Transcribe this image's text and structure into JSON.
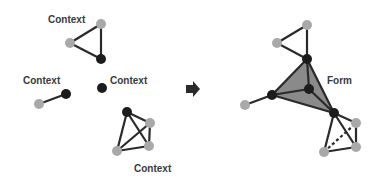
{
  "colors": {
    "background": "#ffffff",
    "edge": "#2a2a2a",
    "node_black": "#1c1c1c",
    "node_gray": "#a9a9a9",
    "form_fill": "#8a8a8a",
    "label": "#3a3a3a",
    "arrow": "#2a2a2a"
  },
  "labels": {
    "context_top": "Context",
    "context_left": "Context",
    "context_middle": "Context",
    "context_bottom": "Context",
    "form": "Form"
  },
  "left_panel": {
    "title": "Separate contexts",
    "groups": [
      {
        "name": "triangle",
        "label": "Context",
        "nodes": [
          "gray",
          "gray",
          "black"
        ]
      },
      {
        "name": "edge-pair",
        "label": "Context",
        "nodes": [
          "black",
          "gray"
        ]
      },
      {
        "name": "single-node",
        "label": "Context",
        "nodes": [
          "black"
        ]
      },
      {
        "name": "k4-clique",
        "label": "Context",
        "nodes": [
          "black",
          "gray",
          "gray",
          "gray"
        ]
      }
    ]
  },
  "arrow": {
    "direction": "right"
  },
  "right_panel": {
    "label": "Form",
    "description": "Contexts merged; black nodes form a shaded triangular form with a central black node",
    "dashed_edge": "gray bottom-left to gray right in the lower clique"
  }
}
